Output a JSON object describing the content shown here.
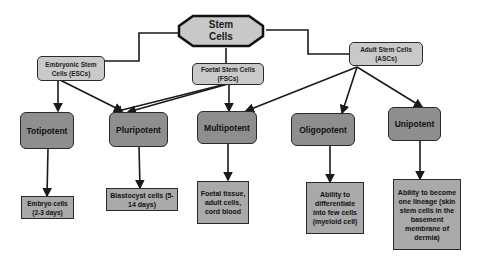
{
  "diagram": {
    "root": {
      "label_line1": "Stem",
      "label_line2": "Cells"
    },
    "sources": [
      {
        "id": "esc",
        "line1": "Embryonic Stem",
        "line2": "Cells (ESCs)"
      },
      {
        "id": "fsc",
        "line1": "Foetal Stem Cells",
        "line2": "(FSCs)"
      },
      {
        "id": "asc",
        "line1": "Adult Stem Cells",
        "line2": "(ASCs)"
      }
    ],
    "potency": [
      {
        "id": "totipotent",
        "label": "Totipotent"
      },
      {
        "id": "pluripotent",
        "label": "Pluripotent"
      },
      {
        "id": "multipotent",
        "label": "Multipotent"
      },
      {
        "id": "oligopotent",
        "label": "Oligopotent"
      },
      {
        "id": "unipotent",
        "label": "Unipotent"
      }
    ],
    "examples": [
      {
        "for": "totipotent",
        "text": "Embryo cells (2-3 days)"
      },
      {
        "for": "pluripotent",
        "text": "Blastocyst cells (5-14 days)"
      },
      {
        "for": "multipotent",
        "text": "Foetal tissue, adult cells, cord blood"
      },
      {
        "for": "oligopotent",
        "text": "Ability to differentiate into few cells (myeloid cell)"
      },
      {
        "for": "unipotent",
        "text": "Ability to become one lineage (skin stem cells in the basement membrane of dermia)"
      }
    ],
    "edges": [
      [
        "Stem Cells",
        "Embryonic Stem Cells (ESCs)"
      ],
      [
        "Stem Cells",
        "Foetal Stem Cells (FSCs)"
      ],
      [
        "Stem Cells",
        "Adult Stem Cells (ASCs)"
      ],
      [
        "ESCs",
        "Totipotent"
      ],
      [
        "ESCs",
        "Pluripotent"
      ],
      [
        "FSCs",
        "Pluripotent"
      ],
      [
        "FSCs",
        "Multipotent"
      ],
      [
        "ASCs",
        "Multipotent"
      ],
      [
        "ASCs",
        "Oligopotent"
      ],
      [
        "ASCs",
        "Unipotent"
      ],
      [
        "Totipotent",
        "Embryo cells (2-3 days)"
      ],
      [
        "Pluripotent",
        "Blastocyst cells (5-14 days)"
      ],
      [
        "Multipotent",
        "Foetal tissue, adult cells, cord blood"
      ],
      [
        "Oligopotent",
        "Ability to differentiate into few cells (myeloid cell)"
      ],
      [
        "Unipotent",
        "Ability to become one lineage ..."
      ]
    ]
  },
  "colors": {
    "root_fill": "#c8c8c8",
    "source_fill": "#c9c9c9",
    "potency_fill": "#8e8e8e",
    "example_fill": "#a9a9a9",
    "line": "#1a1a1a"
  }
}
